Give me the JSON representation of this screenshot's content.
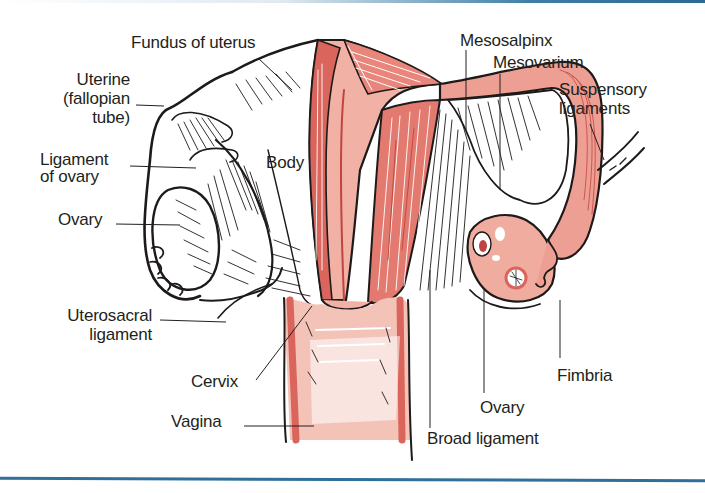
{
  "figure": {
    "colors": {
      "tissue_pink": "#f2b1a5",
      "muscle_red": "#d9655c",
      "deep_red": "#c0443f",
      "outline": "#1e1a1a",
      "frame_blue": "#2f6f98",
      "background": "#ffffff"
    }
  },
  "labels": {
    "fundus": "Fundus of uterus",
    "uterine_tube": [
      "Uterine",
      "(fallopian",
      "tube)"
    ],
    "ligament_of_ovary": [
      "Ligament",
      "of ovary"
    ],
    "ovary_left": "Ovary",
    "body": "Body",
    "uterosacral": [
      "Uterosacral",
      "ligament"
    ],
    "cervix": "Cervix",
    "vagina": "Vagina",
    "mesosalpinx": "Mesosalpinx",
    "mesovarium": "Mesovarium",
    "suspensory": [
      "Suspensory",
      "ligaments"
    ],
    "fimbria": "Fimbria",
    "ovary_right": "Ovary",
    "broad_ligament": "Broad ligament"
  }
}
